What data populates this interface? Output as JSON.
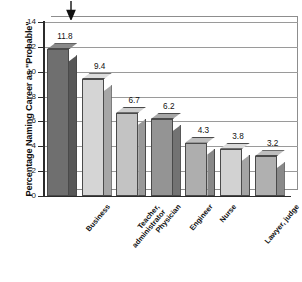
{
  "chart_data": {
    "type": "bar",
    "title": "",
    "subtitle": "",
    "xlabel": "",
    "ylabel": "Percentage Naming Career as \"Probable\"",
    "categories": [
      "Business",
      "Teacher, administrator",
      "Physician",
      "Engineer",
      "Nurse",
      "Lawyer, judge",
      "Therapist (speech, physical, occupational)"
    ],
    "category_lines": [
      [
        "Business"
      ],
      [
        "Teacher,",
        "administrator"
      ],
      [
        "Physician"
      ],
      [
        "Engineer"
      ],
      [
        "Nurse"
      ],
      [
        "Lawyer, judge"
      ],
      [
        "Therapist",
        "(speech, physical,",
        "occupational)"
      ]
    ],
    "values": [
      11.8,
      9.4,
      6.7,
      6.2,
      4.3,
      3.8,
      3.2
    ],
    "value_labels": [
      "11.8",
      "9.4",
      "6.7",
      "6.2",
      "4.3",
      "3.8",
      "3.2"
    ],
    "ylim": [
      0,
      14
    ],
    "yticks": [
      0,
      2,
      4,
      6,
      8,
      10,
      12,
      14
    ],
    "ytick_labels": [
      "0",
      "2",
      "4",
      "6",
      "8",
      "10",
      "12",
      "14"
    ],
    "grid": true,
    "legend": false,
    "style": "3d-bar",
    "bar_colors": [
      "#6f6f6f",
      "#d5d5d5",
      "#c3c3c3",
      "#949494",
      "#aeaeae",
      "#d2d2d2",
      "#b0b0b0"
    ],
    "annotations": [
      {
        "name": "down-arrow",
        "target_category": "Business",
        "symbol": "↓"
      }
    ]
  }
}
